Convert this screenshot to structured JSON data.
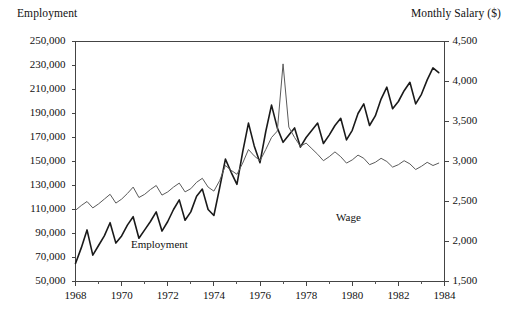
{
  "chart_data": {
    "type": "line",
    "title": "",
    "xlabel": "",
    "ylabel": "Employment",
    "y2label": "Monthly Salary ($)",
    "grid": false,
    "legend_position": "inline-annotations",
    "xlim": [
      1968,
      1984
    ],
    "ylim": [
      50000,
      250000
    ],
    "y2lim": [
      1500,
      4500
    ],
    "x_tick_labels": [
      "1968",
      "1970",
      "1972",
      "1974",
      "1976",
      "1978",
      "1980",
      "1982",
      "1984"
    ],
    "x_tick_values": [
      1968,
      1970,
      1972,
      1974,
      1976,
      1978,
      1980,
      1982,
      1984
    ],
    "x_minor_tick_values": [
      1969,
      1971,
      1973,
      1975,
      1977,
      1979,
      1981,
      1983
    ],
    "y_tick_labels": [
      "250,000",
      "230,000",
      "210,000",
      "190,000",
      "170,000",
      "150,000",
      "130,000",
      "110,000",
      "90,000",
      "70,000",
      "50,000"
    ],
    "y_tick_values": [
      250000,
      230000,
      210000,
      190000,
      170000,
      150000,
      130000,
      110000,
      90000,
      70000,
      50000
    ],
    "y2_tick_labels": [
      "4,500",
      "4,000",
      "3,500",
      "3,000",
      "2,500",
      "2,000",
      "1,500"
    ],
    "y2_tick_values": [
      4500,
      4000,
      3500,
      3000,
      2500,
      2000,
      1500
    ],
    "x": [
      1968.0,
      1968.25,
      1968.5,
      1968.75,
      1969.0,
      1969.25,
      1969.5,
      1969.75,
      1970.0,
      1970.25,
      1970.5,
      1970.75,
      1971.0,
      1971.25,
      1971.5,
      1971.75,
      1972.0,
      1972.25,
      1972.5,
      1972.75,
      1973.0,
      1973.25,
      1973.5,
      1973.75,
      1974.0,
      1974.25,
      1974.5,
      1974.75,
      1975.0,
      1975.25,
      1975.5,
      1975.75,
      1976.0,
      1976.25,
      1976.5,
      1976.75,
      1977.0,
      1977.25,
      1977.5,
      1977.75,
      1978.0,
      1978.25,
      1978.5,
      1978.75,
      1979.0,
      1979.25,
      1979.5,
      1979.75,
      1980.0,
      1980.25,
      1980.5,
      1980.75,
      1981.0,
      1981.25,
      1981.5,
      1981.75,
      1982.0,
      1982.25,
      1982.5,
      1982.75,
      1983.0,
      1983.25,
      1983.5,
      1983.75
    ],
    "series": [
      {
        "name": "Employment",
        "axis": "left",
        "color": "#1a1a1a",
        "values": [
          65000,
          78000,
          93000,
          72000,
          80000,
          88000,
          99000,
          82000,
          88000,
          97000,
          104000,
          86000,
          93000,
          100000,
          108000,
          92000,
          100000,
          110000,
          118000,
          101000,
          108000,
          121000,
          127000,
          110000,
          105000,
          128000,
          152000,
          141000,
          131000,
          158000,
          182000,
          163000,
          149000,
          175000,
          197000,
          178000,
          166000,
          172000,
          178000,
          162000,
          170000,
          176000,
          182000,
          165000,
          172000,
          180000,
          186000,
          168000,
          176000,
          190000,
          198000,
          180000,
          188000,
          202000,
          212000,
          194000,
          200000,
          209000,
          216000,
          198000,
          206000,
          218000,
          228000,
          224000
        ]
      },
      {
        "name": "Wage",
        "axis": "right",
        "color": "#5a5a5a",
        "values": [
          2390,
          2450,
          2500,
          2420,
          2470,
          2530,
          2590,
          2480,
          2530,
          2600,
          2680,
          2550,
          2590,
          2650,
          2700,
          2580,
          2620,
          2680,
          2730,
          2620,
          2660,
          2740,
          2790,
          2680,
          2630,
          2760,
          2950,
          2890,
          2840,
          2980,
          3150,
          3070,
          3010,
          3150,
          3300,
          3380,
          4220,
          3430,
          3300,
          3190,
          3230,
          3160,
          3090,
          3010,
          3060,
          3120,
          3060,
          2980,
          3020,
          3080,
          3040,
          2960,
          2990,
          3040,
          3000,
          2930,
          2960,
          3010,
          2970,
          2900,
          2940,
          2990,
          2950,
          2980
        ]
      }
    ],
    "annotations": [
      {
        "text": "Employment",
        "series": "Employment"
      },
      {
        "text": "Wage",
        "series": "Wage"
      }
    ]
  },
  "axis_titles": {
    "left": "Employment",
    "right": "Monthly Salary ($)"
  }
}
